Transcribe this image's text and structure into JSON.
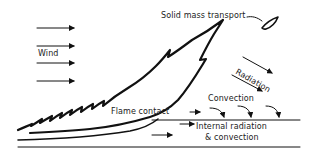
{
  "diagram": {
    "labels": {
      "wind": "Wind",
      "solid_mass_transport": "Solid mass transport",
      "radiation": "Radiation",
      "convection": "Convection",
      "flame_contact": "Flame contact",
      "internal_line1": "Internal radiation",
      "internal_line2": "& convection"
    },
    "elements": {
      "wind_arrows_count": 4,
      "radiation_arrows_count": 2,
      "convection_arrows_count": 3
    },
    "colors": {
      "ink": "#111111",
      "background": "#ffffff"
    }
  }
}
